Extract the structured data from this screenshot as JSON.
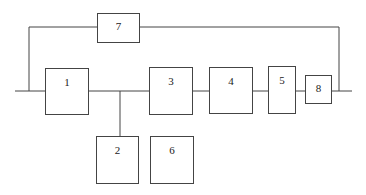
{
  "diagram": {
    "type": "block-diagram",
    "line_color": "#444444",
    "blocks": [
      {
        "id": "1",
        "label": "1"
      },
      {
        "id": "2",
        "label": "2"
      },
      {
        "id": "3",
        "label": "3"
      },
      {
        "id": "4",
        "label": "4"
      },
      {
        "id": "5",
        "label": "5"
      },
      {
        "id": "6",
        "label": "6"
      },
      {
        "id": "7",
        "label": "7"
      },
      {
        "id": "8",
        "label": "8"
      }
    ],
    "connections": [
      [
        "input",
        "1"
      ],
      [
        "1",
        "3"
      ],
      [
        "1-3 junction",
        "2"
      ],
      [
        "3",
        "4"
      ],
      [
        "4",
        "5"
      ],
      [
        "5",
        "8"
      ],
      [
        "8",
        "output"
      ],
      [
        "input junction",
        "7"
      ],
      [
        "7",
        "output junction"
      ]
    ]
  }
}
